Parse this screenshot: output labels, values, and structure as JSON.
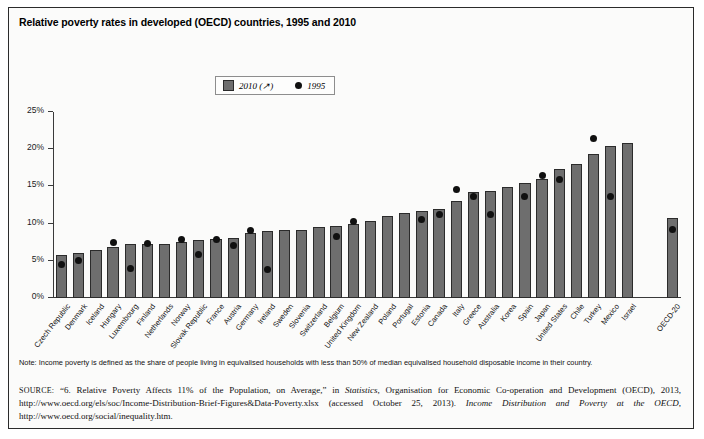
{
  "figure": {
    "title": "Relative poverty rates in developed (OECD) countries, 1995 and 2010",
    "note": "Note: Income poverty is defined as the share of people living in equivalised households with less than 50% of median equivalised household disposable income in their country.",
    "source_label": "SOURCE:",
    "source_part1": "“6. Relative Poverty Affects 11% of the Population, on Average,” in ",
    "source_italic1": "Statistics",
    "source_part2": ", Organisation for Economic Co-operation and Development (OECD), 2013, http://www.oecd.org/els/soc/Income-Distribution-Brief-Figures&Data-Poverty.xlsx (accessed October 25, 2013). ",
    "source_italic2": "Income Distribution and Poverty at the OECD",
    "source_part3": ", http://www.oecd.org/social/inequality.htm."
  },
  "legend": {
    "entries": [
      {
        "label": "2010 (↗)",
        "marker": "square",
        "color": "#6e6e6e"
      },
      {
        "label": "1995",
        "marker": "dot",
        "color": "#101010"
      }
    ]
  },
  "chart_data": {
    "type": "bar",
    "title": "Relative poverty rates in developed (OECD) countries, 1995 and 2010",
    "xlabel": "",
    "ylabel": "",
    "ylim": [
      0,
      25
    ],
    "ytick_labels": [
      "0%",
      "5%",
      "10%",
      "15%",
      "20%",
      "25%"
    ],
    "ytick_values": [
      0,
      5,
      10,
      15,
      20,
      25
    ],
    "grid": false,
    "legend_position": "top-center",
    "categories": [
      "Czech Republic",
      "Denmark",
      "Iceland",
      "Hungary",
      "Luxembourg",
      "Finland",
      "Netherlands",
      "Norway",
      "Slovak Republic",
      "France",
      "Austria",
      "Germany",
      "Ireland",
      "Sweden",
      "Slovenia",
      "Switzerland",
      "Belgium",
      "United Kingdom",
      "New Zealand",
      "Poland",
      "Portugal",
      "Estonia",
      "Canada",
      "Italy",
      "Greece",
      "Australia",
      "Korea",
      "Spain",
      "Japan",
      "United States",
      "Chile",
      "Turkey",
      "Mexico",
      "Israel",
      "OECD-20"
    ],
    "series": [
      {
        "name": "2010 (↗)",
        "marker": "bar",
        "color": "#6e6e6e",
        "values": [
          5.8,
          6.0,
          6.4,
          6.8,
          7.2,
          7.3,
          7.3,
          7.5,
          7.8,
          7.9,
          8.1,
          8.8,
          9.0,
          9.1,
          9.2,
          9.5,
          9.7,
          10.0,
          10.3,
          11.0,
          11.4,
          11.7,
          11.9,
          13.0,
          14.3,
          14.4,
          14.9,
          15.4,
          16.0,
          17.4,
          18.0,
          19.3,
          20.4,
          20.9,
          10.8
        ]
      },
      {
        "name": "1995",
        "marker": "dot",
        "color": "#101010",
        "values": [
          4.5,
          5.0,
          null,
          7.4,
          4.0,
          7.3,
          null,
          7.8,
          5.9,
          7.9,
          7.1,
          9.1,
          3.8,
          null,
          null,
          null,
          8.3,
          10.3,
          null,
          null,
          null,
          10.6,
          11.2,
          14.6,
          13.6,
          11.2,
          null,
          13.7,
          16.5,
          15.9,
          null,
          21.4,
          13.6,
          null,
          9.2
        ]
      }
    ]
  }
}
